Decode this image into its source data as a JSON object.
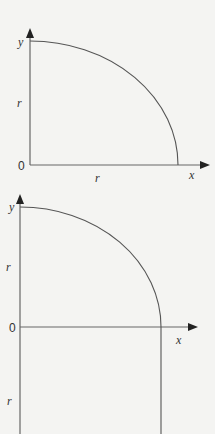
{
  "diagrams": [
    {
      "id": "quarter-circle",
      "labels": {
        "y_axis": "y",
        "x_axis": "x",
        "origin": "0",
        "radius_x": "r",
        "radius_y": "r"
      }
    },
    {
      "id": "quarter-circle-with-extension",
      "labels": {
        "y_axis": "y",
        "x_axis": "x",
        "origin": "0",
        "radius_upper": "r",
        "radius_lower": "r"
      }
    }
  ]
}
